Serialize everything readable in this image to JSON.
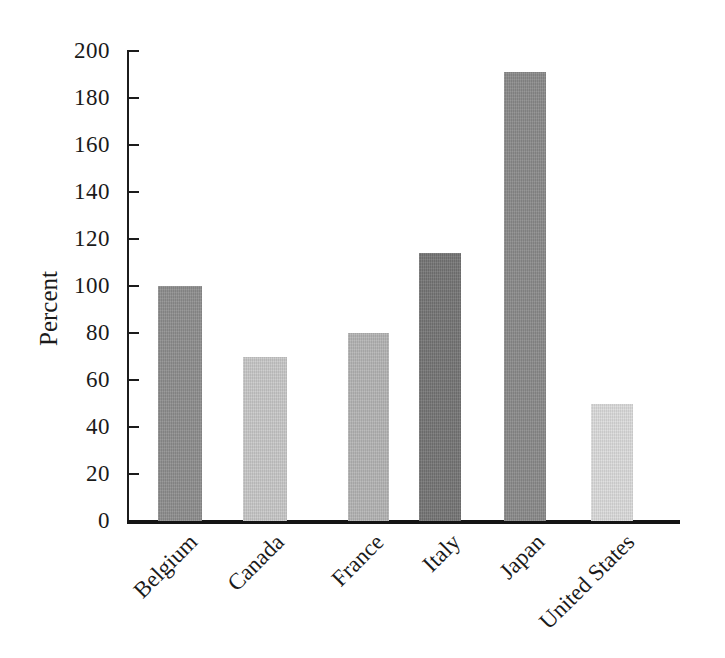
{
  "chart_data": {
    "type": "bar",
    "title": "",
    "subtitle": "",
    "xlabel": "",
    "ylabel": "Percent",
    "categories": [
      "Belgium",
      "Canada",
      "France",
      "Italy",
      "Japan",
      "United States"
    ],
    "values": [
      100,
      70,
      80,
      114,
      191,
      50
    ],
    "bar_colors": [
      "#8e8e8e",
      "#c8c8c8",
      "#b4b4b4",
      "#757575",
      "#8a8a8a",
      "#dcdcdc"
    ],
    "ylim": [
      0,
      200
    ],
    "ytick_step": 20,
    "ytick_labels": [
      "200",
      "180",
      "160",
      "140",
      "120",
      "100",
      "80",
      "60",
      "40",
      "20",
      "0"
    ],
    "ytick_values": [
      200,
      180,
      160,
      140,
      120,
      100,
      80,
      60,
      40,
      20,
      0
    ],
    "grid": false,
    "legend": "none",
    "xtick_rotation_degrees": 45,
    "series": [
      {
        "name": "Percent",
        "values": [
          100,
          70,
          80,
          114,
          191,
          50
        ]
      }
    ],
    "annotations": []
  },
  "axis": {
    "spine_color": "#1c1c1c",
    "baseline_color": "#151515",
    "tick_color": "#1c1c1c"
  },
  "figure": {
    "background": "#ffffff",
    "text_color": "#1a1a1a"
  }
}
